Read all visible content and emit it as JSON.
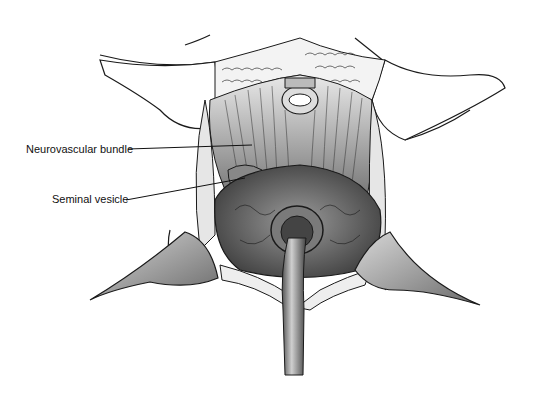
{
  "figure": {
    "type": "surgical-illustration",
    "labels": [
      {
        "text": "Neurovascular bundle",
        "x": 26,
        "y": 150
      },
      {
        "text": "Seminal vesicle",
        "x": 52,
        "y": 199
      }
    ]
  },
  "colors": {
    "ink": "#1a1a1a",
    "tissue_dark": "#3a3a3a",
    "tissue_mid": "#777777",
    "tissue_light": "#bdbdbd",
    "background": "#ffffff"
  }
}
